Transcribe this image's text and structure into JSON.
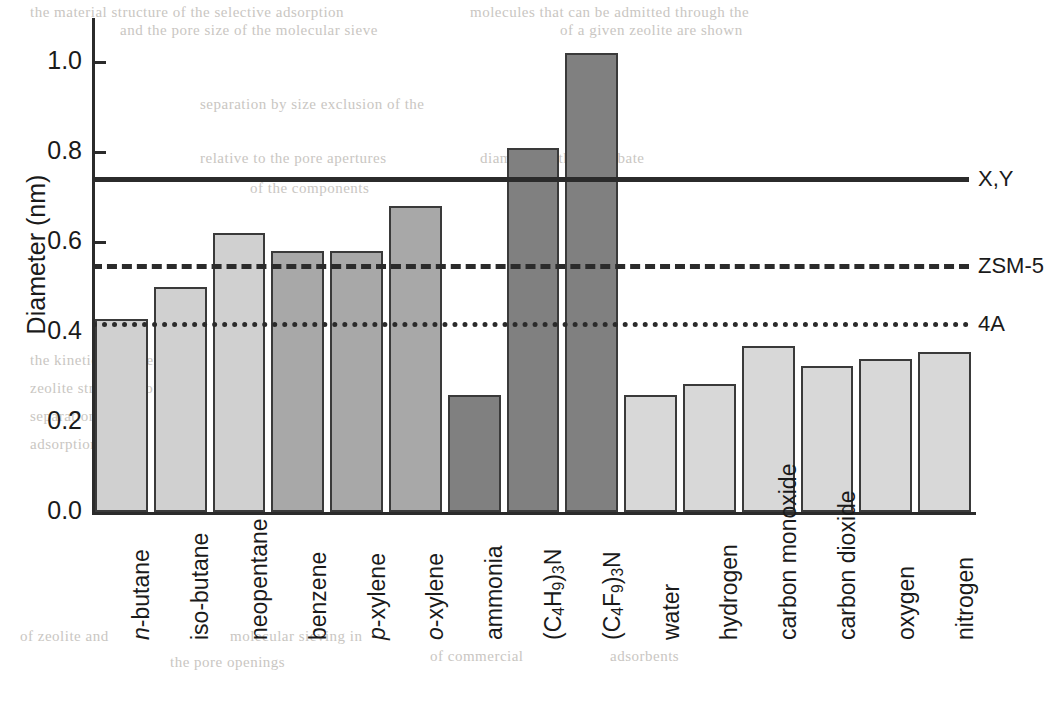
{
  "chart_data": {
    "type": "bar",
    "title": "",
    "xlabel": "",
    "ylabel": "Diameter (nm)",
    "ylim": [
      0.0,
      1.08
    ],
    "yticks": [
      "0.0",
      "0.2",
      "0.4",
      "0.6",
      "0.8",
      "1.0"
    ],
    "grid": false,
    "legend_position": "right",
    "categories": [
      "n-butane",
      "iso-butane",
      "neopentane",
      "benzene",
      "p-xylene",
      "o-xylene",
      "ammonia",
      "(C4H9)3N",
      "(C4F9)3N",
      "water",
      "hydrogen",
      "carbon monoxide",
      "carbon dioxide",
      "oxygen",
      "nitrogen"
    ],
    "values": [
      0.43,
      0.5,
      0.62,
      0.58,
      0.58,
      0.68,
      0.26,
      0.81,
      1.02,
      0.26,
      0.285,
      0.37,
      0.325,
      0.34,
      0.355
    ],
    "bar_fill_colors": [
      "#d0d0d0",
      "#d0d0d0",
      "#d0d0d0",
      "#a8a8a8",
      "#a8a8a8",
      "#a8a8a8",
      "#808080",
      "#808080",
      "#808080",
      "#d8d8d8",
      "#d8d8d8",
      "#d8d8d8",
      "#d8d8d8",
      "#d8d8d8",
      "#d8d8d8"
    ],
    "bar_edge_color": "#3a3a3a",
    "reference_lines": [
      {
        "label": "X,Y",
        "value": 0.74,
        "style": "solid"
      },
      {
        "label": "ZSM-5",
        "value": 0.547,
        "style": "dashed"
      },
      {
        "label": "4A",
        "value": 0.418,
        "style": "dotted"
      }
    ]
  },
  "category_labels_rich": [
    {
      "italic_prefix": "n",
      "rest": "-butane"
    },
    {
      "italic_prefix": "",
      "rest": "iso-butane"
    },
    {
      "italic_prefix": "",
      "rest": "neopentane"
    },
    {
      "italic_prefix": "",
      "rest": "benzene"
    },
    {
      "italic_prefix": "p",
      "rest": "-xylene"
    },
    {
      "italic_prefix": "o",
      "rest": "-xylene"
    },
    {
      "italic_prefix": "",
      "rest": "ammonia"
    },
    {
      "italic_prefix": "",
      "rest": "(C4H9)3N",
      "subscripts": [
        4,
        9,
        3
      ]
    },
    {
      "italic_prefix": "",
      "rest": "(C4F9)3N",
      "subscripts": [
        4,
        9,
        3
      ]
    },
    {
      "italic_prefix": "",
      "rest": "water"
    },
    {
      "italic_prefix": "",
      "rest": "hydrogen"
    },
    {
      "italic_prefix": "",
      "rest": "carbon monoxide"
    },
    {
      "italic_prefix": "",
      "rest": "carbon dioxide"
    },
    {
      "italic_prefix": "",
      "rest": "oxygen"
    },
    {
      "italic_prefix": "",
      "rest": "nitrogen"
    }
  ],
  "page_bleed_text": [
    {
      "text": "the material structure of the selective adsorption",
      "x": 30,
      "y": 4,
      "size": 15
    },
    {
      "text": "molecules that can be admitted through the",
      "x": 470,
      "y": 4,
      "size": 15
    },
    {
      "text": "and the pore size of the molecular sieve",
      "x": 120,
      "y": 22,
      "size": 15
    },
    {
      "text": "of a given zeolite are shown",
      "x": 560,
      "y": 22,
      "size": 15
    },
    {
      "text": "separation by size exclusion of the",
      "x": 200,
      "y": 96,
      "size": 15
    },
    {
      "text": "relative to the pore apertures",
      "x": 200,
      "y": 150,
      "size": 15
    },
    {
      "text": "diameter of the adsorbate",
      "x": 480,
      "y": 150,
      "size": 15
    },
    {
      "text": "of the components",
      "x": 250,
      "y": 180,
      "size": 15
    },
    {
      "text": "the kinetic diameters",
      "x": 30,
      "y": 352,
      "size": 15
    },
    {
      "text": "zeolite structures of the",
      "x": 30,
      "y": 380,
      "size": 15
    },
    {
      "text": "separation",
      "x": 30,
      "y": 408,
      "size": 15
    },
    {
      "text": "adsorption",
      "x": 30,
      "y": 436,
      "size": 15
    },
    {
      "text": "of zeolite and",
      "x": 20,
      "y": 628,
      "size": 15
    },
    {
      "text": "the pore openings",
      "x": 170,
      "y": 654,
      "size": 15
    },
    {
      "text": "molecular sieving in",
      "x": 230,
      "y": 628,
      "size": 15
    },
    {
      "text": "of commercial",
      "x": 430,
      "y": 648,
      "size": 15
    },
    {
      "text": "adsorbents",
      "x": 610,
      "y": 648,
      "size": 15
    }
  ]
}
